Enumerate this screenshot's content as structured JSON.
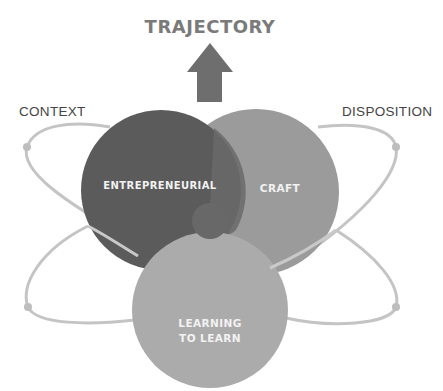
{
  "title": "TRAJECTORY",
  "labels": {
    "context": "CONTEXT",
    "disposition": "DISPOSITION"
  },
  "circles": [
    {
      "id": "entrepreneurial",
      "label": "ENTREPRENEURIAL",
      "color": "#5b5b5b"
    },
    {
      "id": "craft",
      "label": "CRAFT",
      "color": "#9b9b9b"
    },
    {
      "id": "learning",
      "label": "LEARNING TO LEARN",
      "line1": "LEARNING",
      "line2": "TO LEARN",
      "color": "#ababab"
    }
  ],
  "arrow": {
    "direction": "up",
    "color": "#6e6e6e"
  },
  "orbit_color": "#c4c4c4",
  "icons": [
    "up-arrow-icon"
  ]
}
